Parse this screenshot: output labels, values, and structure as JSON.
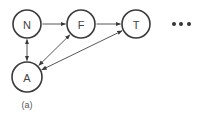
{
  "diagram": {
    "type": "directed-graph",
    "caption": "(a)",
    "colors": {
      "stroke": "#3a3a3a",
      "text": "#444444",
      "background": "#ffffff"
    },
    "nodes": [
      {
        "id": "N",
        "label": "N",
        "cx": 27,
        "cy": 24,
        "r": 14
      },
      {
        "id": "F",
        "label": "F",
        "cx": 81,
        "cy": 24,
        "r": 14
      },
      {
        "id": "T",
        "label": "T",
        "cx": 136,
        "cy": 24,
        "r": 14
      },
      {
        "id": "A",
        "label": "A",
        "cx": 27,
        "cy": 77,
        "r": 15
      }
    ],
    "edges": [
      {
        "from": "N",
        "to": "F",
        "bidirectional": false
      },
      {
        "from": "F",
        "to": "T",
        "bidirectional": false
      },
      {
        "from": "N",
        "to": "A",
        "bidirectional": true
      },
      {
        "from": "A",
        "to": "F",
        "bidirectional": true
      },
      {
        "from": "A",
        "to": "T",
        "bidirectional": true
      }
    ],
    "continuation": "ellipsis",
    "ellipsis_dots": [
      {
        "cx": 174,
        "cy": 24
      },
      {
        "cx": 181,
        "cy": 24
      },
      {
        "cx": 189,
        "cy": 24
      }
    ],
    "caption_pos": {
      "x": 27,
      "y": 108
    }
  }
}
